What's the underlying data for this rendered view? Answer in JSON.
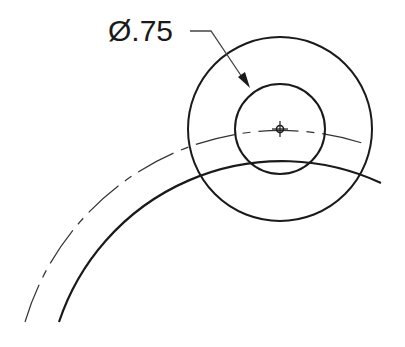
{
  "drawing": {
    "dimension_label": "Ø.75",
    "dimension_type": "diameter",
    "colors": {
      "line": "#1a1a1a",
      "background": "#ffffff"
    }
  }
}
